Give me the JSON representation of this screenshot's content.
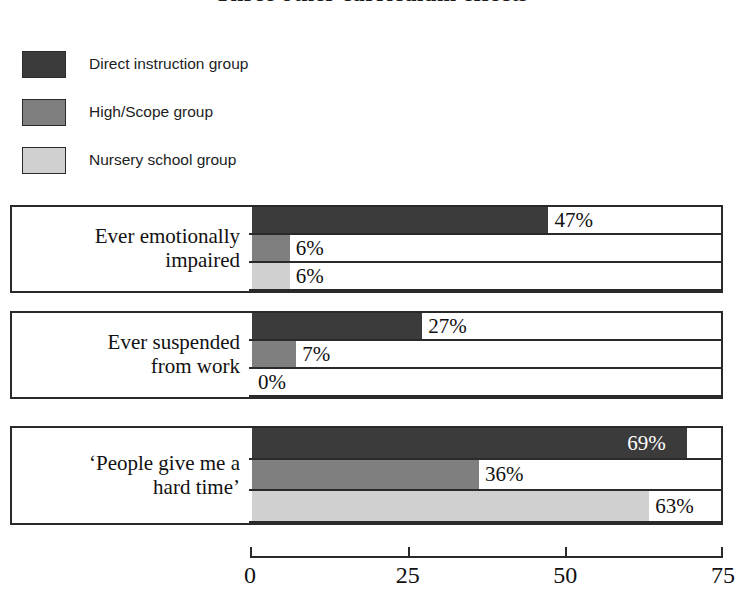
{
  "chart_data": {
    "type": "bar",
    "orientation": "horizontal",
    "title": "Three other curriculum effects",
    "xlabel": "",
    "ylabel": "",
    "xlim": [
      0,
      75
    ],
    "xticks": [
      0,
      25,
      50,
      75
    ],
    "xtick_labels": [
      "0",
      "25",
      "50",
      "75"
    ],
    "grid": false,
    "legend_position": "top-left",
    "value_suffix": "%",
    "categories": [
      "Ever emotionally impaired",
      "Ever suspended from work",
      "'People give me a hard time'"
    ],
    "series": [
      {
        "name": "Direct instruction group",
        "color": "#3b3b3b",
        "values": [
          47,
          27,
          69
        ],
        "labels": [
          "47%",
          "27%",
          "69%"
        ]
      },
      {
        "name": "High/Scope group",
        "color": "#7f7f7f",
        "values": [
          6,
          7,
          36
        ],
        "labels": [
          "6%",
          "7%",
          "36%"
        ]
      },
      {
        "name": "Nursery school group",
        "color": "#d0d0d0",
        "values": [
          6,
          0,
          63
        ],
        "labels": [
          "6%",
          "0%",
          "63%"
        ]
      }
    ]
  },
  "legend": {
    "items": [
      {
        "label": "Direct instruction group",
        "color": "#3b3b3b",
        "swatch_name": "legend-swatch-direct-instruction"
      },
      {
        "label": "High/Scope group",
        "color": "#7f7f7f",
        "swatch_name": "legend-swatch-high-scope"
      },
      {
        "label": "Nursery school group",
        "color": "#d0d0d0",
        "swatch_name": "legend-swatch-nursery-school"
      }
    ]
  },
  "groups": [
    {
      "label_line_1": "Ever emotionally",
      "label_line_2": "impaired",
      "rows": [
        {
          "value": 47,
          "label": "47%",
          "color": "#3b3b3b",
          "label_inside": false
        },
        {
          "value": 6,
          "label": "6%",
          "color": "#7f7f7f",
          "label_inside": false
        },
        {
          "value": 6,
          "label": "6%",
          "color": "#d0d0d0",
          "label_inside": false
        }
      ]
    },
    {
      "label_line_1": "Ever suspended",
      "label_line_2": "from work",
      "rows": [
        {
          "value": 27,
          "label": "27%",
          "color": "#3b3b3b",
          "label_inside": false
        },
        {
          "value": 7,
          "label": "7%",
          "color": "#7f7f7f",
          "label_inside": false
        },
        {
          "value": 0,
          "label": "0%",
          "color": "#d0d0d0",
          "label_inside": false
        }
      ]
    },
    {
      "label_line_1": "‘People give me a",
      "label_line_2": "hard time’",
      "rows": [
        {
          "value": 69,
          "label": "69%",
          "color": "#3b3b3b",
          "label_inside": true
        },
        {
          "value": 36,
          "label": "36%",
          "color": "#7f7f7f",
          "label_inside": false
        },
        {
          "value": 63,
          "label": "63%",
          "color": "#d0d0d0",
          "label_inside": false
        }
      ]
    }
  ],
  "axis": {
    "ticks": [
      {
        "value": 0,
        "label": "0"
      },
      {
        "value": 25,
        "label": "25"
      },
      {
        "value": 50,
        "label": "50"
      },
      {
        "value": 75,
        "label": "75"
      }
    ],
    "max": 75
  }
}
